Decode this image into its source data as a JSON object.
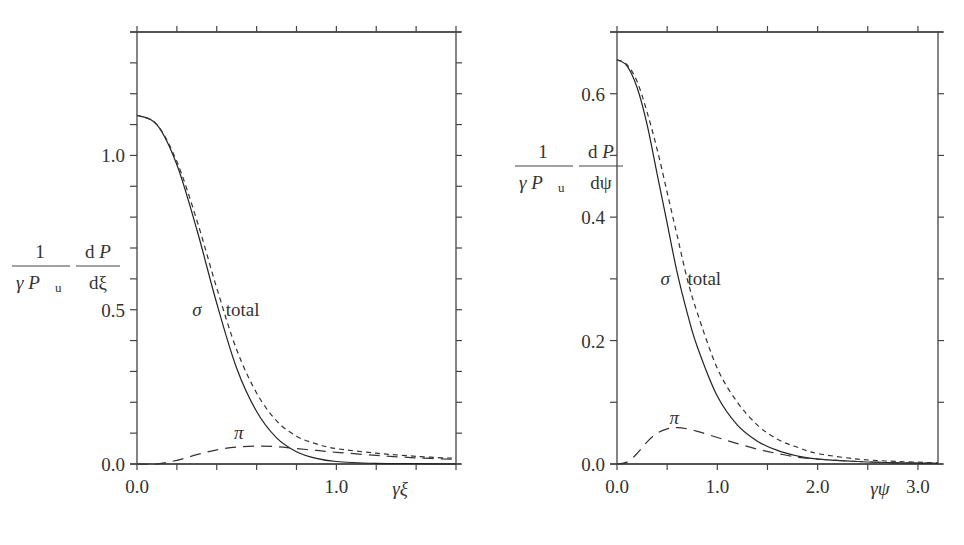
{
  "chart_data": [
    {
      "type": "line",
      "title": "",
      "xlabel": "γξ",
      "ylabel": "(1/(γ P_u)) dP/dξ",
      "ylabel_parts": {
        "num1": "1",
        "den1_a": "γ P",
        "den1_sub": "u",
        "num2": "d P",
        "den2": "dξ"
      },
      "xlim": [
        0,
        1.6
      ],
      "ylim": [
        0,
        1.4
      ],
      "xticks": [
        0.0,
        0.2,
        0.4,
        0.6,
        0.8,
        1.0,
        1.2,
        1.4,
        1.6
      ],
      "xtick_labels": {
        "0.0": "0.0",
        "1.0": "1.0"
      },
      "yticks_minor_step": 0.1,
      "ytick_labels": [
        "0.0",
        "0.5",
        "1.0"
      ],
      "grid": false,
      "legend": "inline annotations",
      "annotations": [
        {
          "text": "σ",
          "x": 0.3,
          "y": 0.5
        },
        {
          "text": "total",
          "x": 0.53,
          "y": 0.5
        },
        {
          "text": "π",
          "x": 0.51,
          "y": 0.1
        }
      ],
      "x": [
        0.0,
        0.1,
        0.2,
        0.3,
        0.4,
        0.5,
        0.6,
        0.7,
        0.8,
        0.9,
        1.0,
        1.2,
        1.4,
        1.6
      ],
      "series": [
        {
          "name": "σ",
          "style": "solid",
          "values": [
            1.13,
            1.1,
            0.97,
            0.76,
            0.52,
            0.31,
            0.17,
            0.085,
            0.04,
            0.018,
            0.008,
            0.002,
            0.001,
            0.0
          ]
        },
        {
          "name": "total",
          "style": "short-dash",
          "values": [
            1.13,
            1.1,
            0.98,
            0.79,
            0.57,
            0.37,
            0.23,
            0.14,
            0.09,
            0.065,
            0.05,
            0.035,
            0.025,
            0.018
          ]
        },
        {
          "name": "π",
          "style": "long-dash",
          "values": [
            0.0,
            0.0,
            0.012,
            0.03,
            0.046,
            0.055,
            0.058,
            0.056,
            0.05,
            0.044,
            0.038,
            0.028,
            0.02,
            0.015
          ]
        }
      ]
    },
    {
      "type": "line",
      "title": "",
      "xlabel": "γψ",
      "ylabel": "(1/(γ P_u)) dP/dψ",
      "ylabel_parts": {
        "num1": "1",
        "den1_a": "γ P",
        "den1_sub": "u",
        "num2": "d P",
        "den2": "dψ"
      },
      "xlim": [
        0,
        3.2
      ],
      "ylim": [
        0,
        0.7
      ],
      "xticks": [
        0.0,
        0.5,
        1.0,
        1.5,
        2.0,
        2.5,
        3.0
      ],
      "xtick_labels": {
        "0.0": "0.0",
        "1.0": "1.0",
        "2.0": "2.0",
        "3.0": "3.0"
      },
      "yticks_minor_step": 0.1,
      "ytick_labels": [
        "0.0",
        "0.2",
        "0.4",
        "0.6"
      ],
      "grid": false,
      "legend": "inline annotations",
      "annotations": [
        {
          "text": "σ",
          "x": 0.48,
          "y": 0.3
        },
        {
          "text": "total",
          "x": 0.87,
          "y": 0.3
        },
        {
          "text": "π",
          "x": 0.57,
          "y": 0.075
        }
      ],
      "x": [
        0.0,
        0.1,
        0.2,
        0.3,
        0.4,
        0.5,
        0.6,
        0.7,
        0.8,
        1.0,
        1.2,
        1.4,
        1.6,
        1.8,
        2.0,
        2.4,
        2.8,
        3.2
      ],
      "series": [
        {
          "name": "σ",
          "style": "solid",
          "values": [
            0.655,
            0.645,
            0.61,
            0.55,
            0.47,
            0.39,
            0.31,
            0.245,
            0.19,
            0.11,
            0.063,
            0.037,
            0.022,
            0.013,
            0.008,
            0.004,
            0.002,
            0.001
          ]
        },
        {
          "name": "total",
          "style": "short-dash",
          "values": [
            0.655,
            0.647,
            0.62,
            0.57,
            0.51,
            0.44,
            0.37,
            0.3,
            0.245,
            0.155,
            0.1,
            0.063,
            0.04,
            0.027,
            0.017,
            0.008,
            0.004,
            0.002
          ]
        },
        {
          "name": "π",
          "style": "long-dash",
          "values": [
            0.0,
            0.003,
            0.017,
            0.036,
            0.05,
            0.057,
            0.059,
            0.057,
            0.053,
            0.043,
            0.033,
            0.024,
            0.017,
            0.011,
            0.008,
            0.004,
            0.002,
            0.001
          ]
        }
      ]
    }
  ]
}
